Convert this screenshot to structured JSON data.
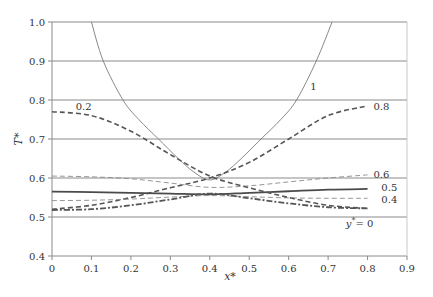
{
  "chart_data": {
    "type": "line",
    "title": "",
    "xlabel": "x*",
    "ylabel": "T*",
    "xlim": [
      0,
      0.9
    ],
    "ylim": [
      0.4,
      1.0
    ],
    "x_ticks": [
      "0",
      "0.1",
      "0.2",
      "0.3",
      "0.4",
      "0.5",
      "0.6",
      "0.7",
      "0.8",
      "0.9"
    ],
    "y_ticks": [
      "0.4",
      "0.5",
      "0.6",
      "0.7",
      "0.8",
      "0.9",
      "1.0"
    ],
    "grid": "horizontal",
    "legend": "inline curve labels",
    "series": [
      {
        "name": "y* = 1",
        "label": "1",
        "style": "solid-thin",
        "x": [
          0.1,
          0.13,
          0.18,
          0.22,
          0.27,
          0.32,
          0.36,
          0.4,
          0.44,
          0.48,
          0.53,
          0.58,
          0.62,
          0.67,
          0.71
        ],
        "y": [
          1.0,
          0.9,
          0.8,
          0.75,
          0.7,
          0.65,
          0.615,
          0.595,
          0.615,
          0.65,
          0.7,
          0.75,
          0.8,
          0.9,
          1.0
        ]
      },
      {
        "name": "y* = 0.8",
        "label": "0.8",
        "style": "dashed-heavy",
        "x": [
          0,
          0.1,
          0.2,
          0.3,
          0.4,
          0.5,
          0.6,
          0.7,
          0.8
        ],
        "y": [
          0.52,
          0.53,
          0.55,
          0.575,
          0.6,
          0.64,
          0.7,
          0.76,
          0.785
        ]
      },
      {
        "name": "y* = 0.6",
        "label": "0.6",
        "style": "dashed-thin",
        "x": [
          0,
          0.1,
          0.2,
          0.3,
          0.4,
          0.5,
          0.6,
          0.7,
          0.8
        ],
        "y": [
          0.605,
          0.603,
          0.598,
          0.587,
          0.576,
          0.58,
          0.59,
          0.6,
          0.608
        ]
      },
      {
        "name": "y* = 0.5",
        "label": "0.5",
        "style": "solid-thick",
        "x": [
          0,
          0.1,
          0.2,
          0.3,
          0.4,
          0.5,
          0.6,
          0.7,
          0.8
        ],
        "y": [
          0.565,
          0.564,
          0.562,
          0.56,
          0.558,
          0.562,
          0.566,
          0.57,
          0.572
        ]
      },
      {
        "name": "y* = 0.4",
        "label": "0.4",
        "style": "dashed-thin",
        "x": [
          0,
          0.1,
          0.2,
          0.3,
          0.4,
          0.5,
          0.6,
          0.7,
          0.8
        ],
        "y": [
          0.542,
          0.543,
          0.546,
          0.551,
          0.555,
          0.552,
          0.549,
          0.548,
          0.548
        ]
      },
      {
        "name": "y* = 0.2",
        "label": "0.2",
        "style": "dashed-heavy",
        "x": [
          0,
          0.1,
          0.2,
          0.3,
          0.4,
          0.5,
          0.6,
          0.7,
          0.8
        ],
        "y": [
          0.77,
          0.76,
          0.72,
          0.66,
          0.605,
          0.575,
          0.55,
          0.53,
          0.522
        ]
      },
      {
        "name": "y* = 0",
        "label": "y* = 0",
        "style": "dashdot-heavy",
        "x": [
          0,
          0.1,
          0.2,
          0.3,
          0.4,
          0.5,
          0.6,
          0.7,
          0.8
        ],
        "y": [
          0.518,
          0.52,
          0.53,
          0.545,
          0.56,
          0.548,
          0.535,
          0.525,
          0.522
        ]
      }
    ],
    "annotations": [
      {
        "text": "1",
        "x": 0.655,
        "y": 0.835
      },
      {
        "text": "0.2",
        "x": 0.06,
        "y": 0.785
      },
      {
        "text": "0.8",
        "x": 0.815,
        "y": 0.785
      },
      {
        "text": "0.6",
        "x": 0.815,
        "y": 0.61
      },
      {
        "text": "0.5",
        "x": 0.835,
        "y": 0.578
      },
      {
        "text": "0.4",
        "x": 0.835,
        "y": 0.545
      },
      {
        "text": "y* = 0",
        "x": 0.745,
        "y": 0.485
      }
    ]
  }
}
